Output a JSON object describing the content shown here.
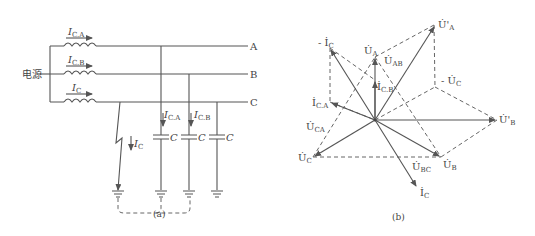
{
  "figure_a": {
    "caption": "(a)",
    "source_label": "电源",
    "phase_labels": [
      "A",
      "B",
      "C"
    ],
    "ct_currents": [
      {
        "symbol": "I",
        "sub": "C.A"
      },
      {
        "symbol": "I",
        "sub": "C.B"
      },
      {
        "symbol": "I",
        "sub": "C"
      }
    ],
    "branch_currents": [
      {
        "symbol": "I",
        "sub": "C.A"
      },
      {
        "symbol": "I",
        "sub": "C.B"
      }
    ],
    "fault_current": {
      "symbol": "I",
      "sub": "C"
    },
    "capacitor_label": "C"
  },
  "figure_b": {
    "caption": "(b)",
    "vectors": {
      "Ua_prime": {
        "symbol": "U̇'",
        "sub": "A"
      },
      "Ua": {
        "symbol": "U̇",
        "sub": "A"
      },
      "Uab": {
        "symbol": "U̇",
        "sub": "AB"
      },
      "neg_Ic": {
        "symbol": "- İ",
        "sub": "C"
      },
      "neg_Uc_prime": {
        "symbol": "- U̇",
        "sub": "C"
      },
      "Ub_prime": {
        "symbol": "U̇'",
        "sub": "B"
      },
      "Ub": {
        "symbol": "U̇",
        "sub": "B"
      },
      "Uc": {
        "symbol": "U̇",
        "sub": "C"
      },
      "Ic": {
        "symbol": "İ",
        "sub": "C"
      },
      "Ica": {
        "symbol": "İ",
        "sub": "C.A"
      },
      "Icb": {
        "symbol": "İ",
        "sub": "C.B"
      },
      "Uca": {
        "symbol": "U̇",
        "sub": "CA"
      },
      "Ubc": {
        "symbol": "U̇",
        "sub": "BC"
      }
    }
  }
}
